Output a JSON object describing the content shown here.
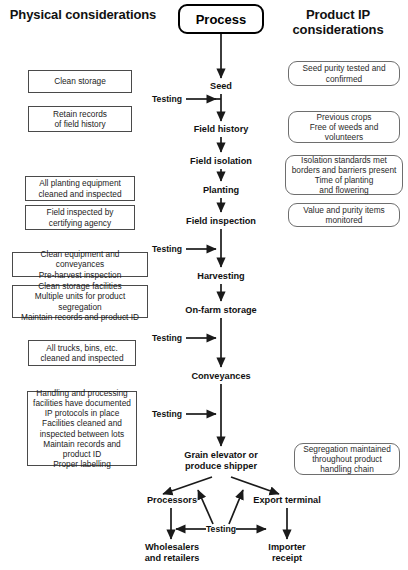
{
  "headings": {
    "left": "Physical\nconsiderations",
    "center": "Process",
    "right": "Product IP\nconsiderations"
  },
  "left_column": [
    {
      "text": "Clean storage"
    },
    {
      "text": "Retain records\nof field history"
    },
    {
      "text": "All planting equipment\ncleaned and inspected"
    },
    {
      "text": "Field inspected by\ncertifying agency"
    },
    {
      "text": "Clean equipment and conveyances\nPre-harvest inspection"
    },
    {
      "text": "Clean storage facilities\nMultiple units for product segregation\nMaintain records and product ID"
    },
    {
      "text": "All trucks, bins, etc.\ncleaned and inspected"
    },
    {
      "text": "Handling and processing\nfacilities have documented\nIP  protocols in place\nFacilities cleaned and\ninspected between lots\nMaintain records and\nproduct ID\nProper labelling"
    }
  ],
  "right_column": [
    {
      "text": "Seed purity tested and\nconfirmed"
    },
    {
      "text": "Previous crops\nFree of weeds and\nvolunteers"
    },
    {
      "text": "Isolation standards met\nborders and barriers present\nTime of planting\nand flowering"
    },
    {
      "text": "Value and purity items\nmonitored"
    },
    {
      "text": "Segregation maintained\nthroughout product\nhandling chain"
    }
  ],
  "flow_steps": [
    {
      "label": "Seed"
    },
    {
      "label": "Field history"
    },
    {
      "label": "Field isolation"
    },
    {
      "label": "Planting"
    },
    {
      "label": "Field inspection"
    },
    {
      "label": "Harvesting"
    },
    {
      "label": "On-farm storage"
    },
    {
      "label": "Conveyances"
    },
    {
      "label": "Grain elevator or\nproduce shipper"
    }
  ],
  "distribution": {
    "processors": "Processors",
    "export_terminal": "Export terminal",
    "wholesalers": "Wholesalers\nand retailers",
    "importer": "Importer\nreceipt",
    "testing": "Testing"
  },
  "testing_labels": [
    {
      "text": "Testing"
    },
    {
      "text": "Testing"
    },
    {
      "text": "Testing"
    },
    {
      "text": "Testing"
    },
    {
      "text": "Testing"
    }
  ],
  "colors": {
    "line": "#1a1a1a",
    "left_box_border": "#4a4a4a",
    "right_box_border": "#6e6e6e",
    "text": "#111111",
    "background": "#ffffff"
  }
}
